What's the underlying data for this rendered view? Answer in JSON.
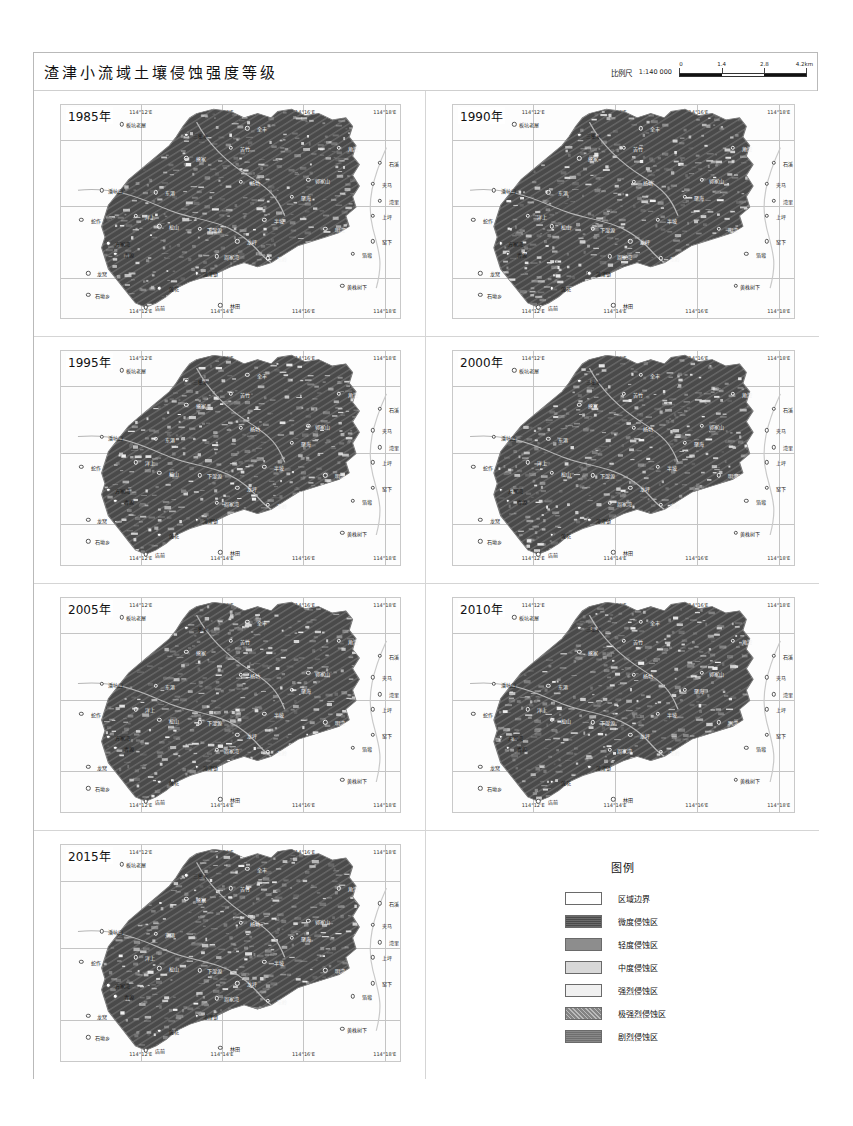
{
  "title": "渣津小流域土壤侵蚀强度等级",
  "scale": {
    "label": "比例尺",
    "ratio": "1:140 000",
    "ticks": [
      "0",
      "1.4",
      "2.8",
      "4.2km"
    ],
    "unit": "km"
  },
  "axis": {
    "longitude": [
      "114°12'E",
      "114°14'E",
      "114°16'E",
      "114°18'E"
    ],
    "latitude": [
      "29°14'N",
      "29°12'N",
      "29°10'N"
    ]
  },
  "panels": [
    {
      "year": "1985年"
    },
    {
      "year": "1990年"
    },
    {
      "year": "1995年"
    },
    {
      "year": "2000年"
    },
    {
      "year": "2005年"
    },
    {
      "year": "2010年"
    },
    {
      "year": "2015年"
    }
  ],
  "places": [
    {
      "name": "板坑老屋",
      "x": 18,
      "y": 9,
      "dark": false
    },
    {
      "name": "三集水",
      "x": 37,
      "y": 14,
      "dark": false
    },
    {
      "name": "全丰",
      "x": 55,
      "y": 11,
      "dark": true
    },
    {
      "name": "角湾",
      "x": 82,
      "y": 20,
      "dark": true
    },
    {
      "name": "石溪",
      "x": 94,
      "y": 27,
      "dark": false
    },
    {
      "name": "熊家",
      "x": 37,
      "y": 25,
      "dark": true
    },
    {
      "name": "苦竹",
      "x": 50,
      "y": 20,
      "dark": true
    },
    {
      "name": "夹马",
      "x": 92,
      "y": 37,
      "dark": false
    },
    {
      "name": "湾里",
      "x": 94,
      "y": 45,
      "dark": false
    },
    {
      "name": "潘坑口",
      "x": 12,
      "y": 40,
      "dark": false
    },
    {
      "name": "东港",
      "x": 28,
      "y": 41,
      "dark": true
    },
    {
      "name": "杨坊",
      "x": 53,
      "y": 36,
      "dark": true
    },
    {
      "name": "郭家山",
      "x": 73,
      "y": 35,
      "dark": true
    },
    {
      "name": "聚海",
      "x": 68,
      "y": 43,
      "dark": true
    },
    {
      "name": "上坪",
      "x": 92,
      "y": 52,
      "dark": false
    },
    {
      "name": "蛇作",
      "x": 6,
      "y": 54,
      "dark": false
    },
    {
      "name": "洋上",
      "x": 22,
      "y": 52,
      "dark": true
    },
    {
      "name": "松山",
      "x": 29,
      "y": 57,
      "dark": true
    },
    {
      "name": "下湿源",
      "x": 41,
      "y": 58,
      "dark": true
    },
    {
      "name": "半坡",
      "x": 60,
      "y": 54,
      "dark": true
    },
    {
      "name": "明湾",
      "x": 78,
      "y": 58,
      "dark": true
    },
    {
      "name": "窑下",
      "x": 92,
      "y": 64,
      "dark": false
    },
    {
      "name": "方家湾",
      "x": 14,
      "y": 65,
      "dark": false
    },
    {
      "name": "青源",
      "x": 16,
      "y": 70,
      "dark": false
    },
    {
      "name": "龙坪",
      "x": 52,
      "y": 64,
      "dark": true
    },
    {
      "name": "周家湾",
      "x": 46,
      "y": 71,
      "dark": true
    },
    {
      "name": "东岭",
      "x": 61,
      "y": 72,
      "dark": true
    },
    {
      "name": "箔塅",
      "x": 86,
      "y": 70,
      "dark": false
    },
    {
      "name": "渣津镇",
      "x": 40,
      "y": 79,
      "dark": false
    },
    {
      "name": "龙窝",
      "x": 8,
      "y": 79,
      "dark": false
    },
    {
      "name": "莲花",
      "x": 29,
      "y": 86,
      "dark": false
    },
    {
      "name": "黄株树下",
      "x": 83,
      "y": 85,
      "dark": false
    },
    {
      "name": "石坳乡",
      "x": 8,
      "y": 89,
      "dark": false
    },
    {
      "name": "店前",
      "x": 25,
      "y": 95,
      "dark": false
    },
    {
      "name": "林田",
      "x": 47,
      "y": 94,
      "dark": false
    }
  ],
  "legend": {
    "title": "图例",
    "items": [
      {
        "label": "区域边界",
        "color": "#ffffff"
      },
      {
        "label": "微度侵蚀区",
        "color": "#4a4a4a"
      },
      {
        "label": "轻度侵蚀区",
        "color": "#8d8d8d"
      },
      {
        "label": "中度侵蚀区",
        "color": "#d8d8d8"
      },
      {
        "label": "强烈侵蚀区",
        "color": "#f0f0f0"
      },
      {
        "label": "极强烈侵蚀区",
        "color": "#848484"
      },
      {
        "label": "剧烈侵蚀区",
        "color": "#6e6e6e"
      }
    ]
  }
}
